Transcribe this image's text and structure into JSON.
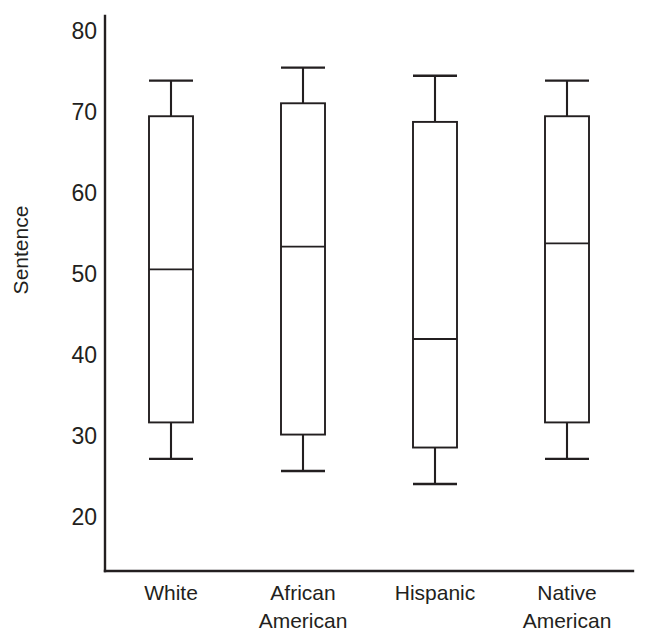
{
  "chart_data": {
    "type": "box",
    "title": "",
    "xlabel": "",
    "ylabel": "Sentence",
    "ylim": [
      17,
      81
    ],
    "yticks": [
      20,
      30,
      40,
      50,
      60,
      70,
      80
    ],
    "ytick_labels": [
      "20",
      "30",
      "40",
      "50",
      "60",
      "70",
      "80"
    ],
    "grid": false,
    "legend": "none",
    "categories": [
      "White",
      "African American",
      "Hispanic",
      "Native American"
    ],
    "category_label_lines": [
      [
        "White"
      ],
      [
        "African",
        "American"
      ],
      [
        "Hispanic"
      ],
      [
        "Native",
        "American"
      ]
    ],
    "boxes": [
      {
        "category": "White",
        "whisker_low": 27.3,
        "q1": 31.8,
        "median": 50.7,
        "q3": 69.6,
        "whisker_high": 74.0
      },
      {
        "category": "African American",
        "whisker_low": 25.8,
        "q1": 30.3,
        "median": 53.5,
        "q3": 71.2,
        "whisker_high": 75.6
      },
      {
        "category": "Hispanic",
        "whisker_low": 24.2,
        "q1": 28.7,
        "median": 42.1,
        "q3": 68.9,
        "whisker_high": 74.6
      },
      {
        "category": "Native American",
        "whisker_low": 27.3,
        "q1": 31.8,
        "median": 53.9,
        "q3": 69.6,
        "whisker_high": 74.0
      }
    ],
    "colors": {
      "line": "#231f20",
      "box_fill": "#ffffff",
      "background": "#ffffff",
      "text": "#231f20"
    }
  }
}
